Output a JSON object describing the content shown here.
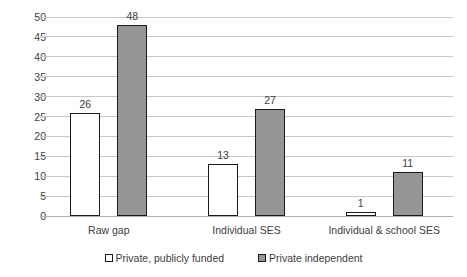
{
  "chart_data": {
    "type": "bar",
    "title": "",
    "subtitle": "",
    "xlabel": "",
    "ylabel": "",
    "categories": [
      "Raw gap",
      "Individual SES",
      "Individual & school SES"
    ],
    "series": [
      {
        "name": "Private, publicly funded",
        "color": "#ffffff",
        "border_color": "#1a1a1a",
        "values": [
          26,
          13,
          1
        ],
        "labels": [
          "26",
          "13",
          "1"
        ]
      },
      {
        "name": "Private independent",
        "color": "#969696",
        "border_color": "#1a1a1a",
        "values": [
          48,
          27,
          11
        ],
        "labels": [
          "48",
          "27",
          "11"
        ]
      }
    ],
    "ylim": [
      0,
      50
    ],
    "ytick_step": 5,
    "ytick_labels": [
      "0",
      "5",
      "10",
      "15",
      "20",
      "25",
      "30",
      "35",
      "40",
      "45",
      "50"
    ],
    "grid": true,
    "grid_axis": "y",
    "grid_color": "#c8c8c8",
    "legend_position": "bottom",
    "data_labels": true
  },
  "legend": {
    "items": [
      {
        "label": "Private, publicly funded",
        "swatch": "series-a"
      },
      {
        "label": "Private independent",
        "swatch": "series-b"
      }
    ]
  }
}
